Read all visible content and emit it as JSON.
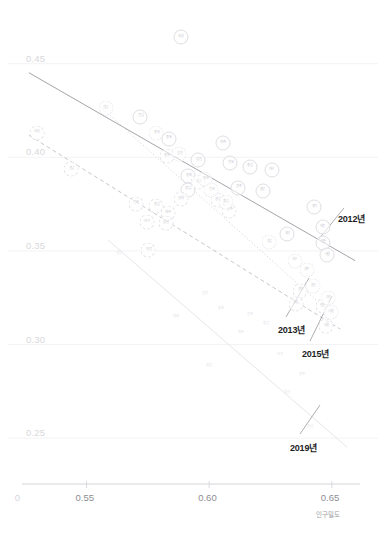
{
  "chart_data": {
    "type": "scatter",
    "title": "",
    "subtitle": "",
    "xlabel": "인구밀도",
    "ylabel": "",
    "xlim": [
      0.518,
      0.668
    ],
    "ylim": [
      0.233,
      0.468
    ],
    "xticks": [
      "0",
      "0.55",
      "0.60",
      "0.65"
    ],
    "xtick_values": [
      0.522,
      0.55,
      0.6,
      0.65
    ],
    "yticks": [
      "0.45",
      "0.40",
      "0.35",
      "0.30",
      "0.25"
    ],
    "ytick_values": [
      0.45,
      0.4,
      0.35,
      0.3,
      0.25
    ],
    "grid": "horizontal",
    "legend": "annotations-with-leader-lines",
    "annotations": [
      {
        "label": "2012년",
        "x": 338,
        "y": 212
      },
      {
        "label": "2013년",
        "x": 278,
        "y": 323
      },
      {
        "label": "2015년",
        "x": 302,
        "y": 347
      },
      {
        "label": "2019년",
        "x": 290,
        "y": 441
      }
    ],
    "series": [
      {
        "name": "2012년",
        "style": "solid",
        "color": "#9a9aa0",
        "trendline": {
          "x0": 0.5265,
          "y0": 0.4452,
          "x1": 0.6595,
          "y1": 0.3448
        },
        "points": [
          {
            "label": "세종",
            "x": 0.5885,
            "y": 0.464
          },
          {
            "label": "전남",
            "x": 0.572,
            "y": 0.4218
          },
          {
            "label": "충북",
            "x": 0.5835,
            "y": 0.41
          },
          {
            "label": "제주",
            "x": 0.6055,
            "y": 0.4075
          },
          {
            "label": "강원",
            "x": 0.5955,
            "y": 0.3985
          },
          {
            "label": "전북",
            "x": 0.6085,
            "y": 0.3968
          },
          {
            "label": "충남",
            "x": 0.6165,
            "y": 0.395
          },
          {
            "label": "대구",
            "x": 0.6255,
            "y": 0.393
          },
          {
            "label": "경북",
            "x": 0.5915,
            "y": 0.3898
          },
          {
            "label": "경남",
            "x": 0.5912,
            "y": 0.3828
          },
          {
            "label": "광주",
            "x": 0.6118,
            "y": 0.3838
          },
          {
            "label": "울산",
            "x": 0.6218,
            "y": 0.3822
          },
          {
            "label": "경기",
            "x": 0.6428,
            "y": 0.3735
          },
          {
            "label": "대전",
            "x": 0.6462,
            "y": 0.3628
          },
          {
            "label": "부산",
            "x": 0.6318,
            "y": 0.359
          },
          {
            "label": "인천",
            "x": 0.6465,
            "y": 0.3545
          },
          {
            "label": "서울",
            "x": 0.6482,
            "y": 0.3478
          }
        ]
      },
      {
        "name": "2013년",
        "style": "dashed",
        "color": "#b9b9c0",
        "trendline": {
          "x0": 0.5265,
          "y0": 0.4118,
          "x1": 0.6535,
          "y1": 0.3082
        },
        "points": [
          {
            "label": "세종",
            "x": 0.5298,
            "y": 0.4132
          },
          {
            "label": "전남",
            "x": 0.5438,
            "y": 0.3938
          },
          {
            "label": "충북",
            "x": 0.5828,
            "y": 0.4005
          },
          {
            "label": "강원",
            "x": 0.5955,
            "y": 0.3868
          },
          {
            "label": "경북",
            "x": 0.5885,
            "y": 0.3775
          },
          {
            "label": "전북",
            "x": 0.57,
            "y": 0.3752
          },
          {
            "label": "충남",
            "x": 0.5785,
            "y": 0.3742
          },
          {
            "label": "제주",
            "x": 0.5832,
            "y": 0.3702
          },
          {
            "label": "경남",
            "x": 0.6035,
            "y": 0.3772
          },
          {
            "label": "광주",
            "x": 0.6082,
            "y": 0.3715
          },
          {
            "label": "대구",
            "x": 0.5745,
            "y": 0.3652
          },
          {
            "label": "울산",
            "x": 0.5822,
            "y": 0.3648
          },
          {
            "label": "대전",
            "x": 0.5752,
            "y": 0.3505
          },
          {
            "label": "경기",
            "x": 0.6372,
            "y": 0.3288
          },
          {
            "label": "부산",
            "x": 0.6352,
            "y": 0.3218
          },
          {
            "label": "인천",
            "x": 0.6462,
            "y": 0.3205
          },
          {
            "label": "서울",
            "x": 0.6478,
            "y": 0.3098
          }
        ]
      },
      {
        "name": "2015년",
        "style": "dotted",
        "color": "#cccdd2",
        "trendline": {
          "x0": 0.5555,
          "y0": 0.4272,
          "x1": 0.6508,
          "y1": 0.3152
        },
        "points": [
          {
            "label": "전남",
            "x": 0.5578,
            "y": 0.4262
          },
          {
            "label": "충북",
            "x": 0.5785,
            "y": 0.4128
          },
          {
            "label": "강원",
            "x": 0.5878,
            "y": 0.4018
          },
          {
            "label": "경북",
            "x": 0.5985,
            "y": 0.3882
          },
          {
            "label": "전북",
            "x": 0.6008,
            "y": 0.3825
          },
          {
            "label": "충남",
            "x": 0.6068,
            "y": 0.376
          },
          {
            "label": "경남",
            "x": 0.6245,
            "y": 0.3548
          },
          {
            "label": "대구",
            "x": 0.6348,
            "y": 0.3448
          },
          {
            "label": "광주",
            "x": 0.6398,
            "y": 0.3398
          },
          {
            "label": "울산",
            "x": 0.6425,
            "y": 0.3312
          },
          {
            "label": "부산",
            "x": 0.6485,
            "y": 0.3248
          },
          {
            "label": "서울",
            "x": 0.6498,
            "y": 0.3172
          }
        ]
      },
      {
        "name": "2019년",
        "style": "solid-light",
        "color": "#e0e0e5",
        "trendline": {
          "x0": 0.5588,
          "y0": 0.3558,
          "x1": 0.6562,
          "y1": 0.2452
        },
        "points": [
          {
            "label": "전남",
            "x": 0.5632,
            "y": 0.3482
          },
          {
            "label": "강원",
            "x": 0.5982,
            "y": 0.3272
          },
          {
            "label": "충북",
            "x": 0.6048,
            "y": 0.3188
          },
          {
            "label": "경북",
            "x": 0.5865,
            "y": 0.3148
          },
          {
            "label": "전북",
            "x": 0.6168,
            "y": 0.3158
          },
          {
            "label": "충남",
            "x": 0.6232,
            "y": 0.3112
          },
          {
            "label": "제주",
            "x": 0.6128,
            "y": 0.3062
          },
          {
            "label": "경남",
            "x": 0.5998,
            "y": 0.2888
          },
          {
            "label": "대구",
            "x": 0.6288,
            "y": 0.2942
          },
          {
            "label": "광주",
            "x": 0.6378,
            "y": 0.2835
          },
          {
            "label": "울산",
            "x": 0.6318,
            "y": 0.2742
          },
          {
            "label": "부산",
            "x": 0.6412,
            "y": 0.2558
          }
        ]
      }
    ]
  }
}
